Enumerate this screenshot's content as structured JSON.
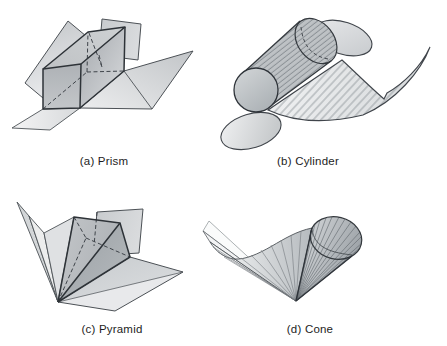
{
  "panels": {
    "a": {
      "label": "(a) Prism",
      "shape": "prism"
    },
    "b": {
      "label": "(b) Cylinder",
      "shape": "cylinder"
    },
    "c": {
      "label": "(c) Pyramid",
      "shape": "pyramid"
    },
    "d": {
      "label": "(d) Cone",
      "shape": "cone"
    }
  },
  "colors": {
    "background": "#ffffff",
    "ink": "#2f343a",
    "edge_soft": "#4c5156",
    "fill_light": "#e9eaec",
    "fill_mid": "#bfc3c6",
    "fill_dark": "#a6abaf",
    "label_text": "#1d1d1d"
  }
}
